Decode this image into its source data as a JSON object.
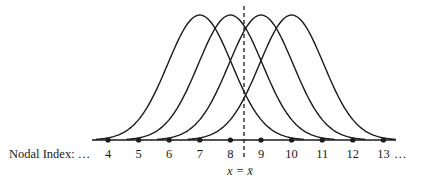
{
  "figure": {
    "axis_label": "Nodal Index: …",
    "trailing_ellipsis": "…",
    "nodes": [
      "4",
      "5",
      "6",
      "7",
      "8",
      "9",
      "10",
      "11",
      "12",
      "13"
    ],
    "basis_function_centers": [
      "7",
      "8",
      "9",
      "10"
    ],
    "marker_label_x": "x = ",
    "marker_label_xbar": "x̄",
    "marker_label": "x = x̄",
    "line_color": "#1a1a1a"
  }
}
